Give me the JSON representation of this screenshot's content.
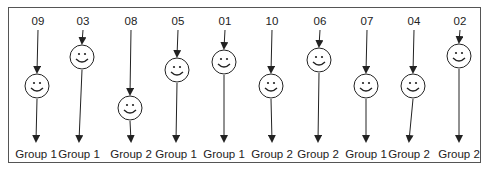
{
  "diagram": {
    "title": "",
    "participants": [
      {
        "id": "09",
        "x": 38,
        "face_y": 86,
        "group": "Group 1",
        "group_x": 36
      },
      {
        "id": "03",
        "x": 83,
        "face_y": 57,
        "group": "Group 1",
        "group_x": 79
      },
      {
        "id": "08",
        "x": 131,
        "face_y": 108,
        "group": "Group 2",
        "group_x": 131
      },
      {
        "id": "05",
        "x": 178,
        "face_y": 70,
        "group": "Group 1",
        "group_x": 176
      },
      {
        "id": "01",
        "x": 225,
        "face_y": 62,
        "group": "Group 1",
        "group_x": 224
      },
      {
        "id": "10",
        "x": 272,
        "face_y": 86,
        "group": "Group 2",
        "group_x": 272
      },
      {
        "id": "06",
        "x": 320,
        "face_y": 60,
        "group": "Group 2",
        "group_x": 318
      },
      {
        "id": "07",
        "x": 367,
        "face_y": 86,
        "group": "Group 1",
        "group_x": 366
      },
      {
        "id": "04",
        "x": 414,
        "face_y": 86,
        "group": "Group 2",
        "group_x": 409
      },
      {
        "id": "02",
        "x": 460,
        "face_y": 56,
        "group": "Group 2",
        "group_x": 459
      }
    ],
    "colors": {
      "stroke": "#222222",
      "border": "#555555",
      "background": "#ffffff"
    }
  }
}
